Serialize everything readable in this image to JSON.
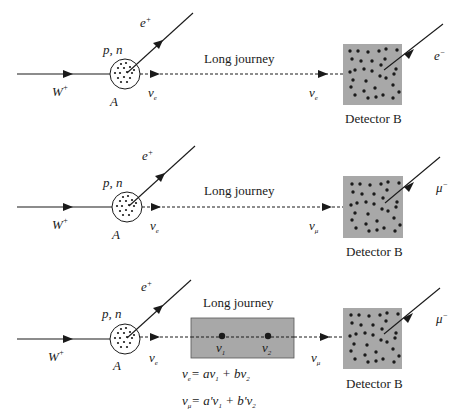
{
  "colors": {
    "ink": "#1a1a1a",
    "detector_fill": "#a8a8a8",
    "oscillation_box_fill": "#a8a8a8",
    "background": "#ffffff"
  },
  "panels": [
    {
      "id": "panel-1",
      "incoming": {
        "label": "W",
        "sup": "+"
      },
      "nucleus": {
        "label": "A",
        "content_label": "p, n"
      },
      "emitted_lepton": {
        "label": "e",
        "sup": "+"
      },
      "neutrino_at_source": {
        "label": "ν",
        "sub": "e"
      },
      "journey_label": "Long journey",
      "neutrino_at_detector": {
        "label": "ν",
        "sub": "e"
      },
      "detector": {
        "label": "Detector B"
      },
      "detected_lepton": {
        "label": "e",
        "sup": "−"
      }
    },
    {
      "id": "panel-2",
      "incoming": {
        "label": "W",
        "sup": "+"
      },
      "nucleus": {
        "label": "A",
        "content_label": "p, n"
      },
      "emitted_lepton": {
        "label": "e",
        "sup": "+"
      },
      "neutrino_at_source": {
        "label": "ν",
        "sub": "e"
      },
      "journey_label": "Long journey",
      "neutrino_at_detector": {
        "label": "ν",
        "sub": "μ"
      },
      "detector": {
        "label": "Detector B"
      },
      "detected_lepton": {
        "label": "μ",
        "sup": "−"
      }
    },
    {
      "id": "panel-3",
      "incoming": {
        "label": "W",
        "sup": "+"
      },
      "nucleus": {
        "label": "A",
        "content_label": "p, n"
      },
      "emitted_lepton": {
        "label": "e",
        "sup": "+"
      },
      "neutrino_at_source": {
        "label": "ν",
        "sub": "e"
      },
      "journey_label": "Long journey",
      "mass_states": [
        {
          "label": "ν",
          "sub": "1"
        },
        {
          "label": "ν",
          "sub": "2"
        }
      ],
      "neutrino_at_detector": {
        "label": "ν",
        "sub": "μ"
      },
      "detector": {
        "label": "Detector B"
      },
      "detected_lepton": {
        "label": "μ",
        "sup": "−"
      },
      "equations": [
        {
          "lhs": "ν",
          "lhs_sub": "e",
          "rhs": "= aν",
          "rhs_sub1": "1",
          "mid": " + bν",
          "rhs_sub2": "2"
        },
        {
          "lhs": "ν",
          "lhs_sub": "μ",
          "rhs": "= a'ν",
          "rhs_sub1": "1",
          "mid": " + b'ν",
          "rhs_sub2": "2"
        }
      ]
    }
  ]
}
